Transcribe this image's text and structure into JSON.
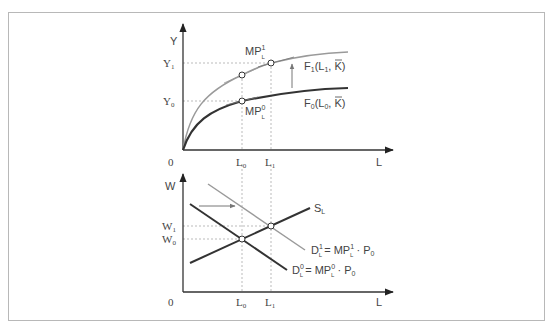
{
  "top_panel": {
    "y_axis_label": "Y",
    "x_axis_label": "L",
    "origin_label": "0",
    "y_ticks": [
      {
        "main": "Y",
        "sub": "1"
      },
      {
        "main": "Y",
        "sub": "0"
      }
    ],
    "x_ticks": [
      {
        "main": "L",
        "sub": "0"
      },
      {
        "main": "L",
        "sub": "1"
      }
    ],
    "curves": [
      {
        "name": "F1",
        "label_main": "F",
        "label_sub": "1",
        "label_args": "(L",
        "label_args_sub": "1",
        "label_tail": ",  K)",
        "color": "#9a9a9a"
      },
      {
        "name": "F0",
        "label_main": "F",
        "label_sub": "0",
        "label_args": "(L",
        "label_args_sub": "0",
        "label_tail": ",  K)",
        "color": "#333333"
      }
    ],
    "mp_labels": [
      {
        "main": "MP",
        "sup": "1",
        "sub": "L"
      },
      {
        "main": "MP",
        "sup": "0",
        "sub": "L"
      }
    ]
  },
  "bottom_panel": {
    "y_axis_label": "W",
    "x_axis_label": "L",
    "origin_label": "0",
    "y_ticks": [
      {
        "main": "W",
        "sub": "1"
      },
      {
        "main": "W",
        "sub": "0"
      }
    ],
    "x_ticks": [
      {
        "main": "L",
        "sub": "0"
      },
      {
        "main": "L",
        "sub": "1"
      }
    ],
    "supply_label": {
      "main": "S",
      "sub": "L"
    },
    "demand_labels": [
      {
        "main": "D",
        "sup": "1",
        "sub": "L",
        "eq": "= MP",
        "eq_sup": "1",
        "eq_sub": "L",
        "tail": " · P",
        "tail_sub": "0",
        "color": "#9a9a9a"
      },
      {
        "main": "D",
        "sup": "0",
        "sub": "L",
        "eq": "= MP",
        "eq_sup": "0",
        "eq_sub": "L",
        "tail": " · P",
        "tail_sub": "0",
        "color": "#333333"
      }
    ]
  },
  "colors": {
    "axis": "#333333",
    "dark_curve": "#333333",
    "light_curve": "#9a9a9a",
    "guide": "#aaaaaa",
    "frame": "#b8b8b8"
  }
}
